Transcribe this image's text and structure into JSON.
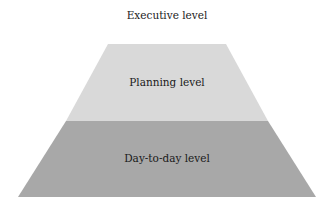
{
  "diagram": {
    "type": "pyramid",
    "levels": [
      {
        "label": "Executive level",
        "color": "#ffffff"
      },
      {
        "label": "Planning level",
        "color": "#d9d9d9"
      },
      {
        "label": "Day-to-day level",
        "color": "#a8a8a8"
      }
    ]
  }
}
